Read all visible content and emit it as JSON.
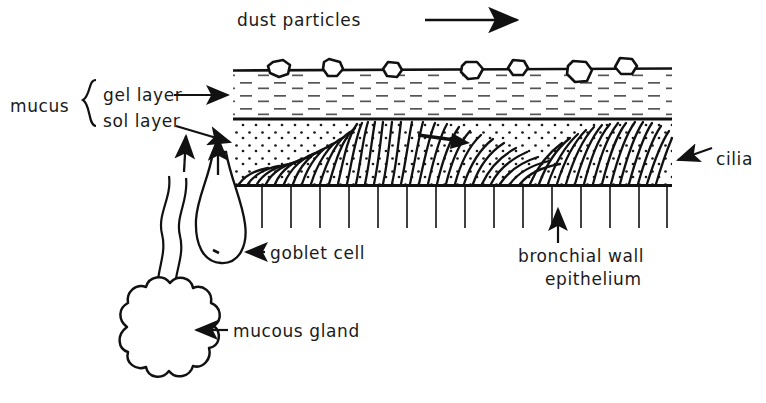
{
  "diagram": {
    "title_text": "dust particles",
    "caption": "Mucociliary clearance in the bronchial airway",
    "labels": {
      "dust_particles": "dust particles",
      "mucus": "mucus",
      "gel_layer": "gel layer",
      "sol_layer": "sol layer",
      "cilia": "cilia",
      "goblet_cell": "goblet cell",
      "bronchial_wall_line1": "bronchial wall",
      "bronchial_wall_line2": "epithelium",
      "mucous_gland": "mucous gland"
    },
    "colors": {
      "ink": "#111111",
      "background": "#ffffff",
      "gel_hatch": "#4a4a4a",
      "sol_stipple": "#1a1a1a"
    },
    "geometry": {
      "diagram_left": 233,
      "diagram_right": 672,
      "top_mucus_line_y": 70,
      "gel_sol_boundary_y": 119,
      "sol_epithelium_boundary_y": 185,
      "epithelium_bottom_y": 228
    },
    "counts": {
      "dust_particles": 7,
      "epithelium_cell_lines": 14,
      "cilia_strokes": 46,
      "gland_lobes": 11
    },
    "flow_direction": "left-to-right"
  }
}
